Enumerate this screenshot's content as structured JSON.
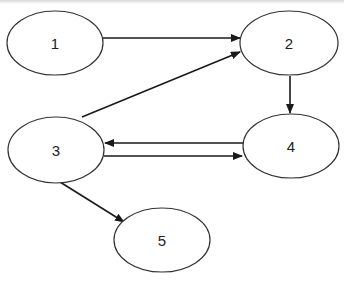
{
  "diagram": {
    "type": "directed-graph",
    "nodes": [
      {
        "id": "1",
        "label": "1",
        "cx": 55,
        "cy": 43,
        "rx": 48,
        "ry": 32
      },
      {
        "id": "2",
        "label": "2",
        "cx": 289,
        "cy": 43,
        "rx": 49,
        "ry": 32
      },
      {
        "id": "3",
        "label": "3",
        "cx": 56,
        "cy": 150,
        "rx": 48,
        "ry": 33
      },
      {
        "id": "4",
        "label": "4",
        "cx": 291,
        "cy": 146,
        "rx": 48,
        "ry": 32
      },
      {
        "id": "5",
        "label": "5",
        "cx": 162,
        "cy": 240,
        "rx": 48,
        "ry": 32
      }
    ],
    "edges": [
      {
        "from": "1",
        "to": "2",
        "x1": 103,
        "y1": 38,
        "x2": 240,
        "y2": 38
      },
      {
        "from": "3",
        "to": "2",
        "x1": 82,
        "y1": 117,
        "x2": 240,
        "y2": 52
      },
      {
        "from": "2",
        "to": "4",
        "x1": 290,
        "y1": 76,
        "x2": 290,
        "y2": 113
      },
      {
        "from": "4",
        "to": "3",
        "x1": 243,
        "y1": 143,
        "x2": 105,
        "y2": 143
      },
      {
        "from": "3",
        "to": "4",
        "x1": 104,
        "y1": 156,
        "x2": 242,
        "y2": 156
      },
      {
        "from": "3",
        "to": "5",
        "x1": 60,
        "y1": 182,
        "x2": 124,
        "y2": 222
      }
    ],
    "colors": {
      "stroke": "#1a1a1a",
      "node_stroke": "#333333",
      "background": "#ffffff"
    }
  }
}
